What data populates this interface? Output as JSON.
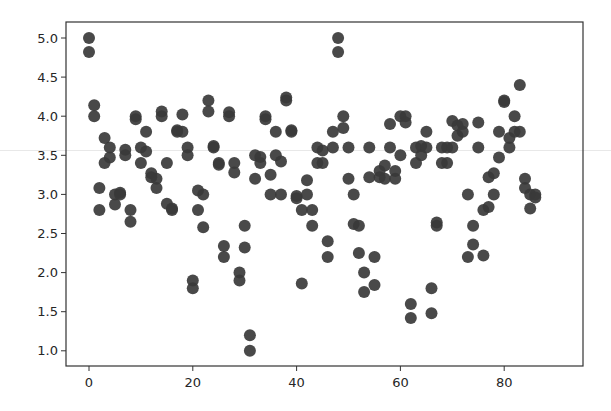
{
  "chart_data": {
    "type": "scatter",
    "title": "",
    "xlabel": "",
    "ylabel": "",
    "xlim": [
      -4.5,
      89
    ],
    "ylim": [
      0.8,
      5.2
    ],
    "grid": false,
    "legend": null,
    "marker_color": "#3a3a3a",
    "marker_size": 12,
    "xticks": [
      0,
      20,
      40,
      60,
      80
    ],
    "xtick_labels": [
      "0",
      "20",
      "40",
      "60",
      "80"
    ],
    "yticks": [
      1.0,
      1.5,
      2.0,
      2.5,
      3.0,
      3.5,
      4.0,
      4.5,
      5.0
    ],
    "ytick_labels": [
      "1.0",
      "1.5",
      "2.0",
      "2.5",
      "3.0",
      "3.5",
      "4.0",
      "4.5",
      "5.0"
    ],
    "points": [
      [
        0,
        5.0
      ],
      [
        0,
        4.82
      ],
      [
        1,
        4.14
      ],
      [
        1,
        4.0
      ],
      [
        2,
        3.08
      ],
      [
        2,
        2.8
      ],
      [
        3,
        3.72
      ],
      [
        3,
        3.4
      ],
      [
        4,
        3.6
      ],
      [
        4,
        3.47
      ],
      [
        5,
        3.0
      ],
      [
        5,
        2.87
      ],
      [
        6,
        3.02
      ],
      [
        6,
        3.0
      ],
      [
        7,
        3.57
      ],
      [
        7,
        3.5
      ],
      [
        8,
        2.8
      ],
      [
        8,
        2.65
      ],
      [
        9,
        4.0
      ],
      [
        9,
        3.96
      ],
      [
        10,
        3.6
      ],
      [
        10,
        3.4
      ],
      [
        11,
        3.8
      ],
      [
        11,
        3.55
      ],
      [
        12,
        3.27
      ],
      [
        12,
        3.22
      ],
      [
        13,
        3.2
      ],
      [
        13,
        3.08
      ],
      [
        14,
        4.06
      ],
      [
        14,
        4.0
      ],
      [
        15,
        3.4
      ],
      [
        15,
        2.88
      ],
      [
        16,
        2.82
      ],
      [
        16,
        2.8
      ],
      [
        17,
        3.82
      ],
      [
        17,
        3.8
      ],
      [
        18,
        4.02
      ],
      [
        18,
        3.8
      ],
      [
        19,
        3.6
      ],
      [
        19,
        3.5
      ],
      [
        20,
        1.9
      ],
      [
        20,
        1.8
      ],
      [
        21,
        3.05
      ],
      [
        21,
        2.8
      ],
      [
        22,
        3.0
      ],
      [
        22,
        2.58
      ],
      [
        23,
        4.2
      ],
      [
        23,
        4.06
      ],
      [
        24,
        3.62
      ],
      [
        24,
        3.6
      ],
      [
        25,
        3.4
      ],
      [
        25,
        3.38
      ],
      [
        26,
        2.34
      ],
      [
        26,
        2.2
      ],
      [
        27,
        4.05
      ],
      [
        27,
        4.0
      ],
      [
        28,
        3.4
      ],
      [
        28,
        3.28
      ],
      [
        29,
        2.0
      ],
      [
        29,
        1.9
      ],
      [
        30,
        2.6
      ],
      [
        30,
        2.32
      ],
      [
        31,
        1.2
      ],
      [
        31,
        1.0
      ],
      [
        32,
        3.5
      ],
      [
        32,
        3.2
      ],
      [
        33,
        3.48
      ],
      [
        33,
        3.4
      ],
      [
        34,
        4.0
      ],
      [
        34,
        3.96
      ],
      [
        35,
        3.25
      ],
      [
        35,
        3.0
      ],
      [
        36,
        3.8
      ],
      [
        36,
        3.5
      ],
      [
        37,
        3.42
      ],
      [
        37,
        3.0
      ],
      [
        38,
        4.24
      ],
      [
        38,
        4.2
      ],
      [
        39,
        3.82
      ],
      [
        39,
        3.8
      ],
      [
        40,
        2.98
      ],
      [
        40,
        2.95
      ],
      [
        41,
        2.8
      ],
      [
        41,
        1.86
      ],
      [
        42,
        3.18
      ],
      [
        42,
        3.0
      ],
      [
        43,
        2.8
      ],
      [
        43,
        2.6
      ],
      [
        44,
        3.6
      ],
      [
        44,
        3.4
      ],
      [
        45,
        3.56
      ],
      [
        45,
        3.4
      ],
      [
        46,
        2.4
      ],
      [
        46,
        2.2
      ],
      [
        47,
        3.8
      ],
      [
        47,
        3.6
      ],
      [
        48,
        5.0
      ],
      [
        48,
        4.82
      ],
      [
        49,
        4.0
      ],
      [
        49,
        3.85
      ],
      [
        50,
        3.6
      ],
      [
        50,
        3.2
      ],
      [
        51,
        3.0
      ],
      [
        51,
        2.62
      ],
      [
        52,
        2.6
      ],
      [
        52,
        2.25
      ],
      [
        53,
        2.0
      ],
      [
        53,
        1.75
      ],
      [
        54,
        3.6
      ],
      [
        54,
        3.22
      ],
      [
        55,
        2.2
      ],
      [
        55,
        1.84
      ],
      [
        56,
        3.3
      ],
      [
        56,
        3.22
      ],
      [
        57,
        3.37
      ],
      [
        57,
        3.2
      ],
      [
        58,
        3.9
      ],
      [
        58,
        3.6
      ],
      [
        59,
        3.3
      ],
      [
        59,
        3.2
      ],
      [
        60,
        4.0
      ],
      [
        60,
        3.5
      ],
      [
        61,
        4.0
      ],
      [
        61,
        3.92
      ],
      [
        62,
        1.6
      ],
      [
        62,
        1.42
      ],
      [
        63,
        3.6
      ],
      [
        63,
        3.4
      ],
      [
        64,
        3.62
      ],
      [
        64,
        3.5
      ],
      [
        65,
        3.8
      ],
      [
        65,
        3.6
      ],
      [
        66,
        1.8
      ],
      [
        66,
        1.48
      ],
      [
        67,
        2.64
      ],
      [
        67,
        2.6
      ],
      [
        68,
        3.6
      ],
      [
        68,
        3.4
      ],
      [
        69,
        3.6
      ],
      [
        69,
        3.4
      ],
      [
        70,
        3.94
      ],
      [
        70,
        3.6
      ],
      [
        71,
        3.88
      ],
      [
        71,
        3.75
      ],
      [
        72,
        3.9
      ],
      [
        72,
        3.8
      ],
      [
        73,
        3.0
      ],
      [
        73,
        2.2
      ],
      [
        74,
        2.6
      ],
      [
        74,
        2.36
      ],
      [
        75,
        3.92
      ],
      [
        75,
        3.6
      ],
      [
        76,
        2.8
      ],
      [
        76,
        2.22
      ],
      [
        77,
        3.22
      ],
      [
        77,
        2.84
      ],
      [
        78,
        3.27
      ],
      [
        78,
        3.0
      ],
      [
        79,
        3.8
      ],
      [
        79,
        3.47
      ],
      [
        80,
        4.2
      ],
      [
        80,
        4.18
      ],
      [
        81,
        3.72
      ],
      [
        81,
        3.6
      ],
      [
        82,
        4.0
      ],
      [
        82,
        3.8
      ],
      [
        83,
        4.4
      ],
      [
        83,
        3.8
      ],
      [
        84,
        3.2
      ],
      [
        84,
        3.08
      ],
      [
        85,
        3.0
      ],
      [
        85,
        2.82
      ],
      [
        86,
        3.0
      ],
      [
        86,
        2.96
      ]
    ]
  },
  "figure": {
    "background": "#ffffff",
    "axes_edge_color": "#333333"
  }
}
